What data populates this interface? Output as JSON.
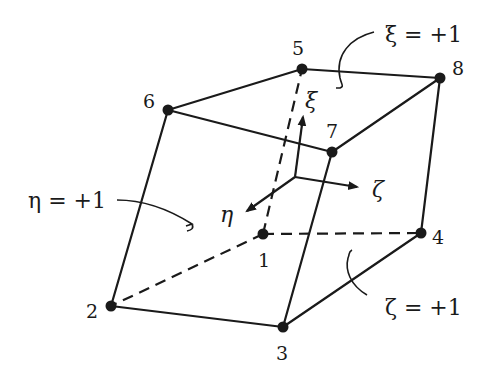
{
  "figure": {
    "colors": {
      "ink": "#1a1a1a",
      "background": "#ffffff"
    }
  },
  "nodes": [
    {
      "id": "1",
      "label": "1",
      "x": 263,
      "y": 234,
      "lx": 258,
      "ly": 267
    },
    {
      "id": "2",
      "label": "2",
      "x": 111,
      "y": 306,
      "lx": 86,
      "ly": 318
    },
    {
      "id": "3",
      "label": "3",
      "x": 283,
      "y": 327,
      "lx": 276,
      "ly": 360
    },
    {
      "id": "4",
      "label": "4",
      "x": 421,
      "y": 233,
      "lx": 432,
      "ly": 244
    },
    {
      "id": "5",
      "label": "5",
      "x": 302,
      "y": 69,
      "lx": 292,
      "ly": 55
    },
    {
      "id": "6",
      "label": "6",
      "x": 168,
      "y": 110,
      "lx": 143,
      "ly": 108
    },
    {
      "id": "7",
      "label": "7",
      "x": 332,
      "y": 152,
      "lx": 326,
      "ly": 138
    },
    {
      "id": "8",
      "label": "8",
      "x": 440,
      "y": 78,
      "lx": 452,
      "ly": 75
    }
  ],
  "edges_visible": [
    [
      "5",
      "8"
    ],
    [
      "6",
      "5"
    ],
    [
      "6",
      "7"
    ],
    [
      "7",
      "8"
    ],
    [
      "6",
      "2"
    ],
    [
      "2",
      "3"
    ],
    [
      "3",
      "7"
    ],
    [
      "3",
      "4"
    ],
    [
      "4",
      "8"
    ]
  ],
  "edges_hidden": [
    [
      "1",
      "5"
    ],
    [
      "1",
      "2"
    ],
    [
      "1",
      "4"
    ]
  ],
  "axes": {
    "origin": {
      "x": 295,
      "y": 177
    },
    "xi": {
      "label": "ξ",
      "tip": {
        "x": 303,
        "y": 117
      },
      "lx": 305,
      "ly": 108
    },
    "zeta": {
      "label": "ζ",
      "tip": {
        "x": 357,
        "y": 187
      },
      "lx": 372,
      "ly": 197
    },
    "eta": {
      "label": "η",
      "tip": {
        "x": 247,
        "y": 211
      },
      "lx": 220,
      "ly": 222
    }
  },
  "face_labels": [
    {
      "id": "xi-plus",
      "text": "ξ = +1",
      "x": 385,
      "y": 42
    },
    {
      "id": "eta-plus",
      "text": "η = +1",
      "x": 28,
      "y": 208
    },
    {
      "id": "zeta-plus",
      "text": "ζ = +1",
      "x": 385,
      "y": 315
    }
  ]
}
